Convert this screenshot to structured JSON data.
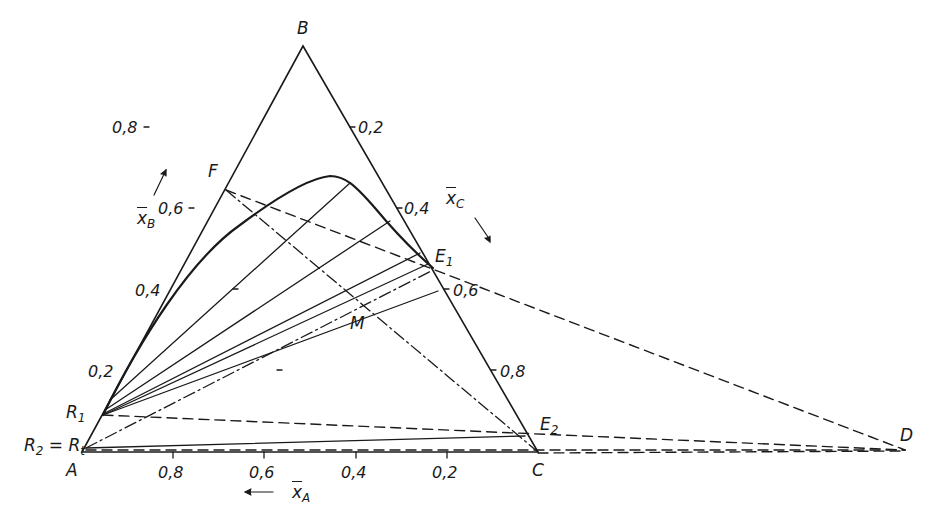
{
  "figure": {
    "type": "ternary-diagram"
  },
  "vertices": {
    "A": "A",
    "B": "B",
    "C": "C"
  },
  "points": {
    "D": "D",
    "F": "F",
    "M": "M",
    "E1": {
      "base": "E",
      "sub": "1"
    },
    "E2": {
      "base": "E",
      "sub": "2"
    },
    "R1": {
      "base": "R",
      "sub": "1"
    },
    "R2_eq_Rt": {
      "base": "R",
      "sub": "2",
      "mid": " = ",
      "base2": "R",
      "sub2": "t"
    }
  },
  "axes": {
    "xA": {
      "symbol": "x",
      "sub": "A",
      "ticks": [
        "0,8",
        "0,6",
        "0,4",
        "0,2"
      ]
    },
    "xB": {
      "symbol": "x",
      "sub": "B",
      "ticks": [
        "0,8",
        "0,6",
        "0,4",
        "0,2"
      ]
    },
    "xC": {
      "symbol": "x",
      "sub": "C",
      "ticks": [
        "0,2",
        "0,4",
        "0,6",
        "0,8"
      ]
    }
  },
  "colors": {
    "ink": "#1a1a1a",
    "background": "#ffffff"
  }
}
